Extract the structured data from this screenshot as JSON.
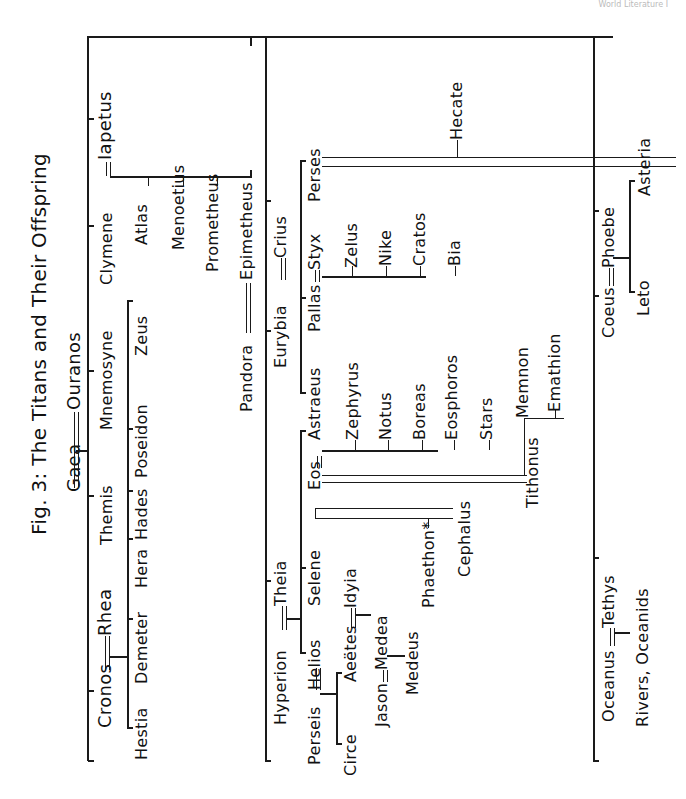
{
  "header": {
    "running_head": "World Literature I"
  },
  "figure": {
    "title": "Fig. 3: The Titans and Their Offspring",
    "progenitors": {
      "left": "Gaea",
      "right": "Ouranos"
    },
    "titans": [
      "Cronos",
      "Rhea",
      "Themis",
      "Mnemosyne",
      "Clymene",
      "Iapetus",
      "Hyperion",
      "Theia",
      "Eurybia",
      "Crius",
      "Coeus",
      "Phoebe",
      "Oceanus",
      "Tethys"
    ],
    "nodes": {
      "cronos": "Cronos",
      "rhea": "Rhea",
      "themis": "Themis",
      "gaea": "Gaea",
      "ouranos": "Ouranos",
      "mnemosyne": "Mnemosyne",
      "clymene": "Clymene",
      "iapetus": "Iapetus",
      "hestia": "Hestia",
      "demeter": "Demeter",
      "hera": "Hera",
      "hades": "Hades",
      "poseidon": "Poseidon",
      "zeus": "Zeus",
      "atlas": "Atlas",
      "menoetius": "Menoetius",
      "prometheus": "Prometheus",
      "pandora": "Pandora",
      "epimetheus": "Epimetheus",
      "hyperion": "Hyperion",
      "theia": "Theia",
      "eurybia": "Eurybia",
      "crius": "Crius",
      "perseis": "Perseis",
      "helios": "Helios",
      "selene": "Selene",
      "eos": "Eos",
      "astraeus": "Astraeus",
      "pallas": "Pallas",
      "styx": "Styx",
      "perses": "Perses",
      "hecate": "Hecate",
      "zelus": "Zelus",
      "nike": "Nike",
      "cratos": "Cratos",
      "bia": "Bia",
      "zephyrus": "Zephyrus",
      "notus": "Notus",
      "boreas": "Boreas",
      "eosphoros": "Eosphoros",
      "stars": "Stars",
      "circe": "Circe",
      "aeetes": "Aeëtes",
      "idyia": "Idyia",
      "jason": "Jason",
      "medea": "Medea",
      "medeus": "Medeus",
      "phaethon": "Phaethon*",
      "cephalus": "Cephalus",
      "tithonus": "Tithonus",
      "memnon": "Memnon",
      "emathion": "Emathion",
      "coeus": "Coeus",
      "phoebe": "Phoebe",
      "leto": "Leto",
      "asteria": "Asteria",
      "oceanus": "Oceanus",
      "tethys": "Tethys",
      "rivers": "Rivers, Oceanids"
    },
    "unions": [
      [
        "Gaea",
        "Ouranos"
      ],
      [
        "Cronos",
        "Rhea"
      ],
      [
        "Clymene",
        "Iapetus"
      ],
      [
        "Pandora",
        "Epimetheus"
      ],
      [
        "Hyperion",
        "Theia"
      ],
      [
        "Eurybia",
        "Crius"
      ],
      [
        "Perseis",
        "Helios"
      ],
      [
        "Aeëtes",
        "Idyia"
      ],
      [
        "Jason",
        "Medea"
      ],
      [
        "Eos",
        "Astraeus"
      ],
      [
        "Pallas",
        "Styx"
      ],
      [
        "Eos",
        "Tithonus"
      ],
      [
        "Eos",
        "Cephalus"
      ],
      [
        "Perses",
        "Asteria"
      ],
      [
        "Coeus",
        "Phoebe"
      ],
      [
        "Oceanus",
        "Tethys"
      ]
    ]
  }
}
